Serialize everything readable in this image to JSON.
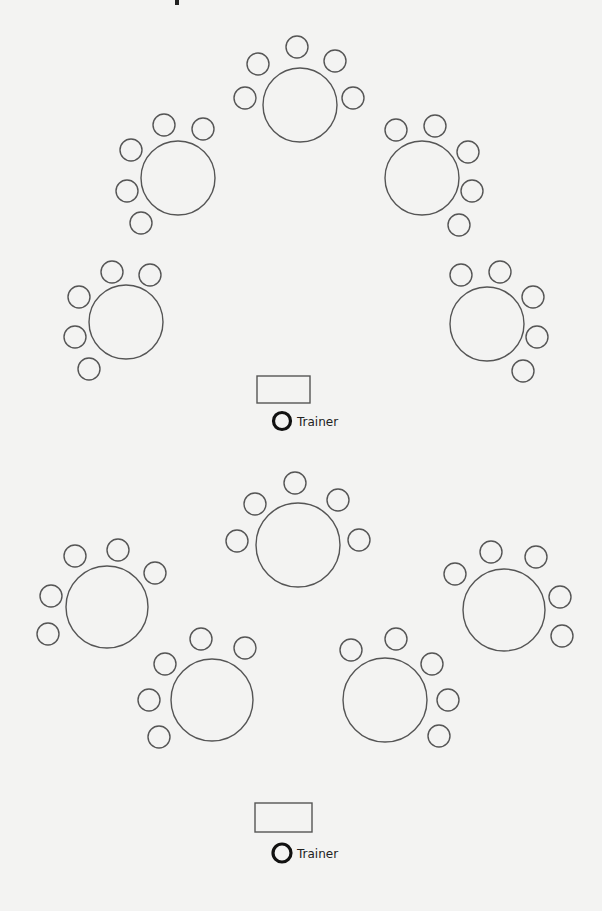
{
  "diagram": {
    "type": "classroom-seating-layout",
    "background": "#f3f3f2",
    "stroke_color": "#555555",
    "trainer_color": "#111111"
  },
  "sections": [
    {
      "name": "upper-room",
      "tables": [
        {
          "id": 1,
          "cx": 300,
          "cy": 105,
          "r": 37,
          "chairs": [
            [
              297,
              47
            ],
            [
              258,
              64
            ],
            [
              335,
              61
            ],
            [
              245,
              98
            ],
            [
              353,
              98
            ]
          ]
        },
        {
          "id": 2,
          "cx": 178,
          "cy": 178,
          "r": 37,
          "chairs": [
            [
              164,
              125
            ],
            [
              203,
              129
            ],
            [
              131,
              150
            ],
            [
              127,
              191
            ],
            [
              141,
              223
            ]
          ]
        },
        {
          "id": 3,
          "cx": 422,
          "cy": 178,
          "r": 37,
          "chairs": [
            [
              396,
              130
            ],
            [
              435,
              126
            ],
            [
              468,
              152
            ],
            [
              472,
              191
            ],
            [
              459,
              225
            ]
          ]
        },
        {
          "id": 4,
          "cx": 126,
          "cy": 322,
          "r": 37,
          "chairs": [
            [
              112,
              272
            ],
            [
              150,
              275
            ],
            [
              79,
              297
            ],
            [
              75,
              337
            ],
            [
              89,
              369
            ]
          ]
        },
        {
          "id": 5,
          "cx": 487,
          "cy": 324,
          "r": 37,
          "chairs": [
            [
              461,
              275
            ],
            [
              500,
              272
            ],
            [
              533,
              297
            ],
            [
              537,
              337
            ],
            [
              523,
              371
            ]
          ]
        }
      ],
      "trainer_desk": {
        "x": 257,
        "y": 376,
        "w": 53,
        "h": 27
      },
      "trainer": {
        "cx": 282,
        "cy": 421,
        "r": 8.5,
        "label": "Trainer",
        "label_x": 297,
        "label_y": 426
      }
    },
    {
      "name": "lower-room",
      "tables": [
        {
          "id": 6,
          "cx": 298,
          "cy": 545,
          "r": 42,
          "chairs": [
            [
              295,
              483
            ],
            [
              255,
              504
            ],
            [
              338,
              500
            ],
            [
              237,
              541
            ],
            [
              359,
              540
            ]
          ]
        },
        {
          "id": 7,
          "cx": 107,
          "cy": 607,
          "r": 41,
          "chairs": [
            [
              75,
              556
            ],
            [
              118,
              550
            ],
            [
              155,
              573
            ],
            [
              51,
              596
            ],
            [
              48,
              634
            ]
          ]
        },
        {
          "id": 8,
          "cx": 504,
          "cy": 610,
          "r": 41,
          "chairs": [
            [
              455,
              574
            ],
            [
              491,
              552
            ],
            [
              536,
              557
            ],
            [
              560,
              597
            ],
            [
              562,
              636
            ]
          ]
        },
        {
          "id": 9,
          "cx": 212,
          "cy": 700,
          "r": 41,
          "chairs": [
            [
              201,
              639
            ],
            [
              245,
              648
            ],
            [
              165,
              664
            ],
            [
              149,
              700
            ],
            [
              159,
              737
            ]
          ]
        },
        {
          "id": 10,
          "cx": 385,
          "cy": 700,
          "r": 42,
          "chairs": [
            [
              351,
              650
            ],
            [
              396,
              639
            ],
            [
              432,
              664
            ],
            [
              448,
              700
            ],
            [
              439,
              736
            ]
          ]
        }
      ],
      "trainer_desk": {
        "x": 255,
        "y": 803,
        "w": 57,
        "h": 29
      },
      "trainer": {
        "cx": 282,
        "cy": 853,
        "r": 9,
        "label": "Trainer",
        "label_x": 297,
        "label_y": 858
      }
    }
  ],
  "chair_radius": 11
}
